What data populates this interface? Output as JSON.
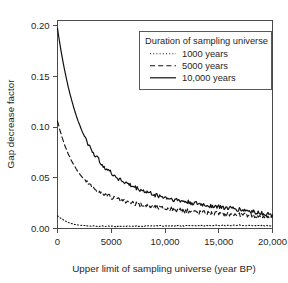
{
  "chart_data": {
    "type": "line",
    "title": "",
    "xlabel": "Upper limit of sampling universe (year BP)",
    "ylabel": "Gap decrease factor",
    "xlim": [
      0,
      20000
    ],
    "ylim": [
      0,
      0.205
    ],
    "grid": false,
    "legend_position": "top-right",
    "legend_title": "Duration of sampling universe",
    "xticks": [
      0,
      5000,
      10000,
      15000,
      20000
    ],
    "xticklabels": [
      "0",
      "5000",
      "10,000",
      "15,000",
      "20,000"
    ],
    "yticks": [
      0.0,
      0.05,
      0.1,
      0.15,
      0.2
    ],
    "yticklabels": [
      "0.00",
      "0.05",
      "0.10",
      "0.15",
      "0.20"
    ],
    "series": [
      {
        "name": "1000 years",
        "style": "dotted",
        "color": "#111111",
        "x": [
          0,
          250,
          500,
          750,
          1000,
          1250,
          1500,
          1750,
          2000,
          2500,
          3000,
          3500,
          4000,
          4500,
          5000,
          5500,
          6000,
          6500,
          7000,
          7500,
          8000,
          8500,
          9000,
          9500,
          10000,
          10500,
          11000,
          11500,
          12000,
          12500,
          13000,
          13500,
          14000,
          14500,
          15000,
          15500,
          16000,
          16500,
          17000,
          17500,
          18000,
          18500,
          19000,
          19500,
          20000
        ],
        "values": [
          0.0125,
          0.0105,
          0.0088,
          0.0072,
          0.006,
          0.005,
          0.0043,
          0.0038,
          0.0034,
          0.0029,
          0.0026,
          0.0024,
          0.0023,
          0.0022,
          0.0021,
          0.0022,
          0.0021,
          0.0023,
          0.0022,
          0.0024,
          0.0023,
          0.0025,
          0.0024,
          0.0026,
          0.0025,
          0.0024,
          0.0026,
          0.0025,
          0.0027,
          0.0026,
          0.0028,
          0.0027,
          0.0029,
          0.0028,
          0.003,
          0.0029,
          0.0031,
          0.003,
          0.0032,
          0.0031,
          0.003,
          0.0029,
          0.0028,
          0.0027,
          0.0026
        ]
      },
      {
        "name": "5000 years",
        "style": "dashed",
        "color": "#111111",
        "x": [
          0,
          250,
          500,
          750,
          1000,
          1250,
          1500,
          1750,
          2000,
          2250,
          2500,
          2750,
          3000,
          3250,
          3500,
          3750,
          4000,
          4250,
          4500,
          4750,
          5000,
          5500,
          6000,
          6500,
          7000,
          7500,
          8000,
          8500,
          9000,
          9500,
          10000,
          10500,
          11000,
          11500,
          12000,
          12500,
          13000,
          13500,
          14000,
          14500,
          15000,
          15500,
          16000,
          16500,
          17000,
          17500,
          18000,
          18500,
          19000,
          19500,
          20000
        ],
        "values": [
          0.106,
          0.096,
          0.0875,
          0.08,
          0.0735,
          0.068,
          0.063,
          0.0585,
          0.0545,
          0.0512,
          0.0482,
          0.0456,
          0.0432,
          0.041,
          0.039,
          0.0372,
          0.0356,
          0.0342,
          0.033,
          0.0318,
          0.0308,
          0.0288,
          0.0272,
          0.0258,
          0.0246,
          0.0236,
          0.0228,
          0.022,
          0.0212,
          0.0205,
          0.0198,
          0.0191,
          0.0185,
          0.0179,
          0.0173,
          0.0168,
          0.0163,
          0.0159,
          0.0155,
          0.0152,
          0.0149,
          0.0146,
          0.0143,
          0.014,
          0.0136,
          0.0132,
          0.0128,
          0.0124,
          0.012,
          0.0116,
          0.0112
        ]
      },
      {
        "name": "10,000 years",
        "style": "solid",
        "color": "#111111",
        "x": [
          0,
          250,
          500,
          750,
          1000,
          1250,
          1500,
          1750,
          2000,
          2250,
          2500,
          2750,
          3000,
          3250,
          3500,
          3750,
          4000,
          4250,
          4500,
          4750,
          5000,
          5500,
          6000,
          6500,
          7000,
          7500,
          8000,
          8500,
          9000,
          9500,
          10000,
          10500,
          11000,
          11500,
          12000,
          12500,
          13000,
          13500,
          14000,
          14500,
          15000,
          15500,
          16000,
          16500,
          17000,
          17500,
          18000,
          18500,
          19000,
          19500,
          20000
        ],
        "values": [
          0.197,
          0.18,
          0.165,
          0.1515,
          0.1395,
          0.129,
          0.1195,
          0.111,
          0.1035,
          0.0968,
          0.0908,
          0.0855,
          0.0806,
          0.0762,
          0.0722,
          0.0686,
          0.0653,
          0.0623,
          0.0596,
          0.057,
          0.0547,
          0.0506,
          0.0471,
          0.0441,
          0.0414,
          0.0391,
          0.037,
          0.0352,
          0.0335,
          0.032,
          0.0306,
          0.0293,
          0.0282,
          0.0271,
          0.0261,
          0.0252,
          0.0243,
          0.0235,
          0.0228,
          0.0221,
          0.0214,
          0.0207,
          0.02,
          0.0193,
          0.0186,
          0.0178,
          0.017,
          0.0161,
          0.0152,
          0.0143,
          0.0134
        ]
      }
    ]
  }
}
